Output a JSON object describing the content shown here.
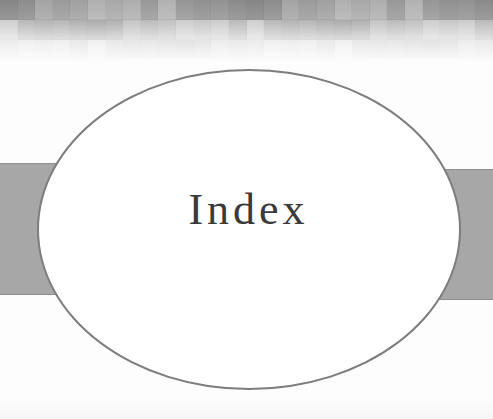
{
  "page": {
    "type": "section-divider",
    "title": "Index"
  },
  "colors": {
    "background": "#fdfdfd",
    "band_fill": "#a7a7a7",
    "band_edge": "#8e8e8e",
    "oval_stroke": "#7d7d7d",
    "oval_fill": "#ffffff",
    "title_text": "#3a3a3a"
  },
  "decor": {
    "header_strip": "grayscale-mosaic-fading-to-white",
    "side_bands": [
      "left-band",
      "right-band"
    ],
    "center_shape": "ellipse-outline"
  }
}
